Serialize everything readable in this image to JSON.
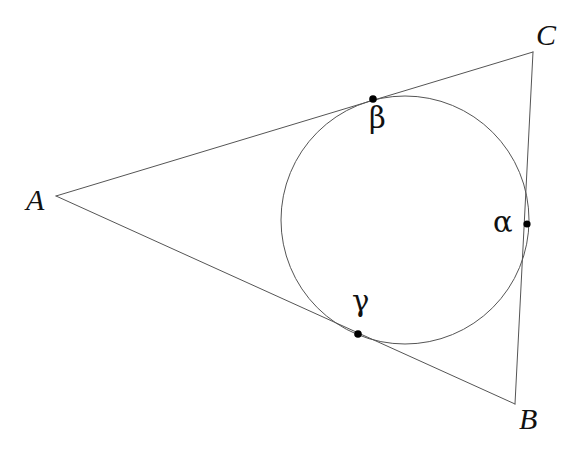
{
  "figure": {
    "kind": "geometry-diagram",
    "background_color": "#ffffff",
    "stroke_color": "#555555",
    "point_color": "#000000",
    "label_color": "#111111",
    "canvas": {
      "width": 571,
      "height": 454
    }
  },
  "triangle": {
    "stroke_width": 1,
    "vertices": [
      {
        "name": "A",
        "label": "A",
        "x": 56,
        "y": 196,
        "label_x": 26,
        "label_y": 185
      },
      {
        "name": "B",
        "label": "B",
        "x": 515,
        "y": 404,
        "label_x": 519,
        "label_y": 404
      },
      {
        "name": "C",
        "label": "C",
        "x": 533,
        "y": 52,
        "label_x": 536,
        "label_y": 20
      }
    ],
    "edges": [
      {
        "name": "side-AC",
        "from": "A",
        "to": "C"
      },
      {
        "name": "side-AB",
        "from": "A",
        "to": "B"
      },
      {
        "name": "side-CB",
        "from": "C",
        "to": "B"
      }
    ]
  },
  "incircle": {
    "center_x": 405,
    "center_y": 220,
    "radius": 124,
    "stroke_width": 1
  },
  "tangent_points": [
    {
      "name": "alpha",
      "label": "α",
      "x": 527,
      "y": 224,
      "dot_radius": 3.6,
      "label_x": 493,
      "label_y": 208,
      "on_edge": "side-CB"
    },
    {
      "name": "beta",
      "label": "β",
      "x": 373,
      "y": 99,
      "dot_radius": 3.8,
      "label_x": 369,
      "label_y": 104,
      "on_edge": "side-AC"
    },
    {
      "name": "gamma",
      "label": "γ",
      "x": 358,
      "y": 334,
      "dot_radius": 3.8,
      "label_x": 352,
      "label_y": 287,
      "on_edge": "side-AB"
    }
  ]
}
